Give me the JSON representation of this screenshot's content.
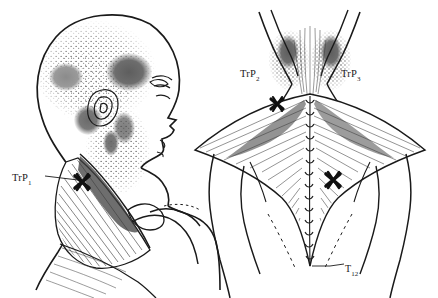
{
  "figure": {
    "background_color": "#ffffff",
    "ink_color": "#1a1a1a",
    "pain_patch_color": "#6a6a6a",
    "stipple_color": "#555555",
    "marker_color": "#101010"
  },
  "labels": {
    "trp1": {
      "main": "TrP",
      "sub": "1"
    },
    "trp2": {
      "main": "TrP",
      "sub": "2"
    },
    "trp3": {
      "main": "TrP",
      "sub": "3"
    },
    "t12": {
      "main": "T",
      "sub": "12"
    }
  },
  "panels": {
    "left": {
      "name": "lateral-head-neck-view",
      "description": "Side profile of head, neck and shoulder with upper trapezius muscle",
      "trigger_points": [
        "TrP1"
      ],
      "referred_pain_regions": [
        "posterolateral neck",
        "mastoid",
        "temple",
        "angle of jaw"
      ]
    },
    "right": {
      "name": "posterior-back-view",
      "description": "Posterior view of neck and upper back showing trapezius muscle diamond",
      "trigger_points": [
        "TrP2",
        "TrP3"
      ],
      "referred_pain_regions": [
        "suboccipital",
        "upper medial border of scapula"
      ],
      "vertebra_marker": "T12"
    }
  }
}
